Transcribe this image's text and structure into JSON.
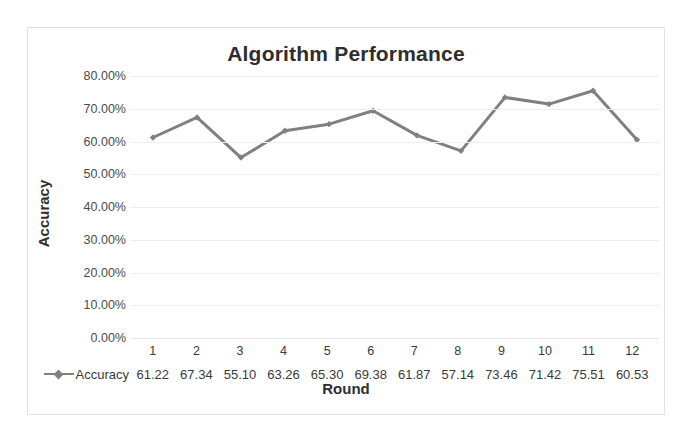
{
  "chart_data": {
    "type": "line",
    "title": "Algorithm Performance",
    "xlabel": "Round",
    "ylabel": "Accuracy",
    "categories": [
      "1",
      "2",
      "3",
      "4",
      "5",
      "6",
      "7",
      "8",
      "9",
      "10",
      "11",
      "12"
    ],
    "series": [
      {
        "name": "Accuracy",
        "values": [
          61.22,
          67.34,
          55.1,
          63.26,
          65.3,
          69.38,
          61.87,
          57.14,
          73.46,
          71.42,
          75.51,
          60.53
        ],
        "value_labels": [
          "61.22",
          "67.34",
          "55.10",
          "63.26",
          "65.30",
          "69.38",
          "61.87",
          "57.14",
          "73.46",
          "71.42",
          "75.51",
          "60.53"
        ],
        "color": "#808080",
        "marker": "diamond"
      }
    ],
    "ylim": [
      0,
      80
    ],
    "y_tick_values": [
      80,
      70,
      60,
      50,
      40,
      30,
      20,
      10,
      0
    ],
    "y_tick_labels": [
      "80.00%",
      "70.00%",
      "60.00%",
      "50.00%",
      "40.00%",
      "30.00%",
      "20.00%",
      "10.00%",
      "0.00%"
    ],
    "grid": true,
    "grid_color": "#ededed",
    "legend_position": "data-table",
    "show_data_table": true,
    "plot_background": "#ffffff",
    "border_color": "#e2e2e2",
    "text_color": "#2e2e2e"
  },
  "legend": {
    "series_label": "Accuracy",
    "marker_icon": "line-diamond-marker-icon"
  }
}
